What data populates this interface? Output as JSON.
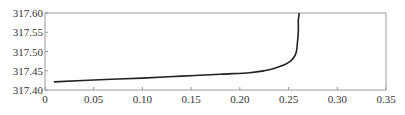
{
  "chart_data": {
    "type": "line",
    "title": "",
    "xlabel": "",
    "ylabel": "",
    "xlim": [
      0,
      0.35
    ],
    "ylim": [
      317.4,
      317.6
    ],
    "grid": false,
    "legend": null,
    "x_ticks": [
      "0",
      "0.05",
      "0.10",
      "0.15",
      "0.20",
      "0.25",
      "0.30",
      "0.35"
    ],
    "y_ticks": [
      "317.40",
      "317.45",
      "317.50",
      "317.55",
      "317.60"
    ],
    "series": [
      {
        "name": "curve",
        "color": "#222222",
        "x": [
          0.009,
          0.05,
          0.1,
          0.14,
          0.18,
          0.21,
          0.225,
          0.235,
          0.245,
          0.252,
          0.256,
          0.258,
          0.259,
          0.26,
          0.26,
          0.261
        ],
        "y": [
          317.421,
          317.426,
          317.431,
          317.436,
          317.441,
          317.445,
          317.45,
          317.456,
          317.465,
          317.475,
          317.487,
          317.5,
          317.52,
          317.55,
          317.58,
          317.6
        ]
      }
    ]
  }
}
